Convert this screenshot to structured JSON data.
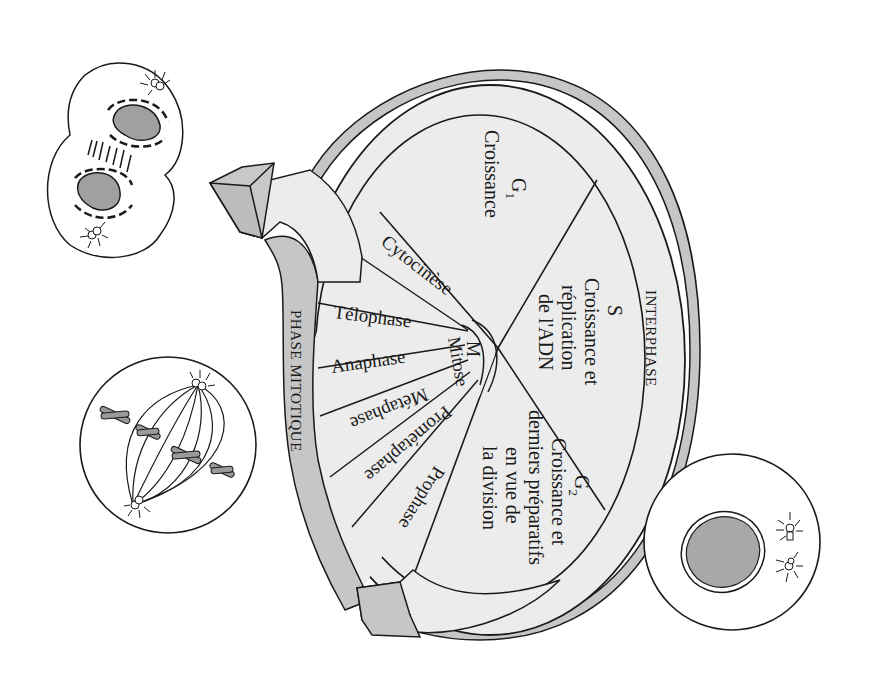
{
  "diagram": {
    "colors": {
      "wheel_fill": "#ececec",
      "band_fill": "#c6c6c6",
      "arrow_fill": "#c8c8c8",
      "outline": "#1a1a1a",
      "nucleus_fill": "#a8a8a8",
      "chromosome_fill": "#9a9a9a"
    },
    "phases": {
      "interphase_label": "INTERPHASE",
      "mitotic_label": "PHASE MITOTIQUE",
      "g1": {
        "name": "G",
        "sub": "1",
        "desc": "Croissance"
      },
      "s": {
        "name": "S",
        "desc_lines": [
          "Croissance et",
          "réplication",
          "de l'ADN"
        ]
      },
      "g2": {
        "name": "G",
        "sub": "2",
        "desc_lines": [
          "Croissance et",
          "derniers préparatifs",
          "en vue de",
          "la division"
        ]
      },
      "m": {
        "name": "M",
        "desc": "Mitose"
      }
    },
    "mitosis_stages": [
      {
        "label": "Prophase"
      },
      {
        "label": "Prométaphase"
      },
      {
        "label": "Métaphase"
      },
      {
        "label": "Anaphase"
      },
      {
        "label": "Télophase"
      },
      {
        "label": "Cytocinèse"
      }
    ],
    "cells": [
      {
        "stage": "interphase",
        "description": "Cellule en interphase avec noyau et centrosomes dupliqués"
      },
      {
        "stage": "metaphase",
        "description": "Cellule en métaphase avec fuseau et chromosomes alignés"
      },
      {
        "stage": "telophase",
        "description": "Cellule en télophase / cytocinèse se divisant en deux"
      }
    ]
  }
}
